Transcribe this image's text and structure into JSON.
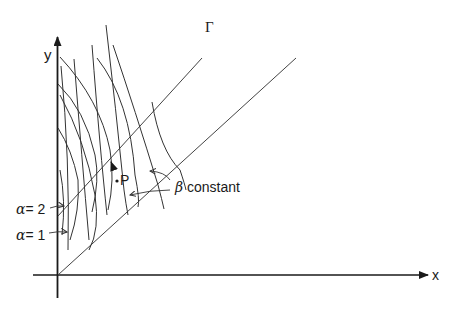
{
  "figure": {
    "axes": {
      "x_label": "x",
      "y_label": "y"
    },
    "boundary_curve_label": "Γ",
    "point_label": "P",
    "beta_annotation": {
      "symbol": "β",
      "text": "constant"
    },
    "alpha_labels": [
      {
        "symbol": "α",
        "eq": "= 2"
      },
      {
        "symbol": "α",
        "eq": "= 1"
      }
    ],
    "colors": {
      "ink": "#1a1a1a",
      "line": "#333333",
      "background": "#ffffff"
    }
  }
}
